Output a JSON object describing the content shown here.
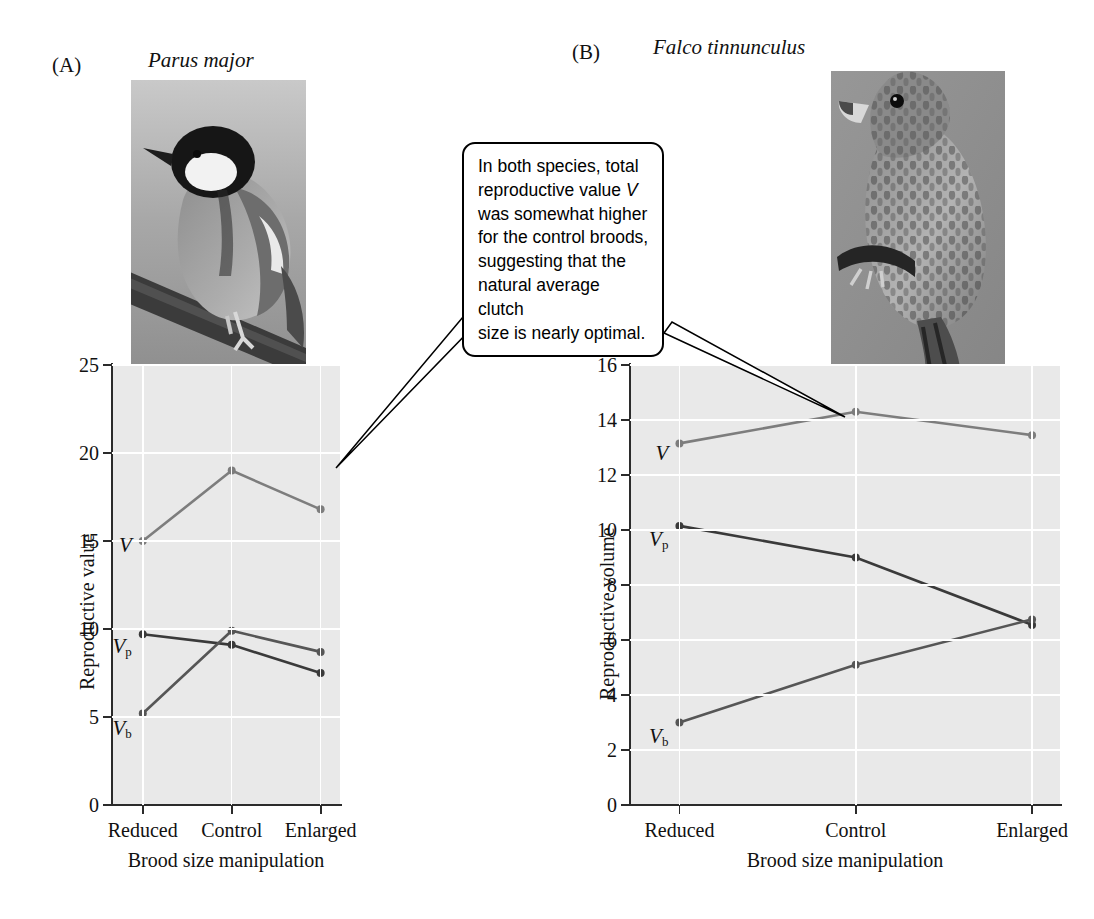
{
  "figure": {
    "panels": [
      {
        "letter": "(A)",
        "species": "Parus major",
        "photo_alt": "great-tit-photo",
        "ylabel": "Reproductive value",
        "xlabel": "Brood size manipulation"
      },
      {
        "letter": "(B)",
        "species": "Falco tinnunculus",
        "photo_alt": "kestrel-photo",
        "ylabel": "Reproductive volume",
        "xlabel": "Brood size manipulation"
      }
    ]
  },
  "callout": {
    "line1": "In both species, total",
    "line2_a": "reproductive value ",
    "line2_v": "V",
    "line3": "was somewhat higher",
    "line4": "for the control broods,",
    "line5": "suggesting that the",
    "line6": "natural average clutch",
    "line7": "size is nearly optimal.",
    "full_text": "In both species, total reproductive value V was somewhat higher for the control broods, suggesting that the natural average clutch size is nearly optimal."
  },
  "series_labels": {
    "v": "V",
    "vp_base": "V",
    "vp_sub": "p",
    "vb_base": "V",
    "vb_sub": "b"
  },
  "colors": {
    "plot_background": "#e9e9e9",
    "gridline": "#ffffff",
    "axis": "#2b2b2b",
    "series_v": "#7d7d7d",
    "series_vp": "#3a3a3a",
    "series_vb": "#565656",
    "photo_background": "#8f8f8f",
    "callout_border": "#000000",
    "text": "#111111"
  },
  "chart_data": [
    {
      "type": "line",
      "title": "Parus major",
      "panel": "(A)",
      "xlabel": "Brood size manipulation",
      "ylabel": "Reproductive value",
      "categories": [
        "Reduced",
        "Control",
        "Enlarged"
      ],
      "ylim": [
        0,
        25
      ],
      "yticks": [
        0,
        5,
        10,
        15,
        20,
        25
      ],
      "grid": true,
      "legend": "inline-labels-left",
      "series": [
        {
          "name": "V",
          "label": "V",
          "values": [
            15.0,
            19.0,
            16.8
          ]
        },
        {
          "name": "V_p",
          "label": "Vp",
          "values": [
            9.7,
            9.1,
            7.5
          ]
        },
        {
          "name": "V_b",
          "label": "Vb",
          "values": [
            5.2,
            9.9,
            8.7
          ]
        }
      ]
    },
    {
      "type": "line",
      "title": "Falco tinnunculus",
      "panel": "(B)",
      "xlabel": "Brood size manipulation",
      "ylabel": "Reproductive volume",
      "categories": [
        "Reduced",
        "Control",
        "Enlarged"
      ],
      "ylim": [
        0,
        16
      ],
      "yticks": [
        0,
        2,
        4,
        6,
        8,
        10,
        12,
        14,
        16
      ],
      "grid": true,
      "legend": "inline-labels-left",
      "series": [
        {
          "name": "V",
          "label": "V",
          "values": [
            13.15,
            14.3,
            13.45
          ]
        },
        {
          "name": "V_p",
          "label": "Vp",
          "values": [
            10.15,
            9.0,
            6.55
          ]
        },
        {
          "name": "V_b",
          "label": "Vb",
          "values": [
            3.0,
            5.1,
            6.75
          ]
        }
      ]
    }
  ],
  "axis_a": {
    "yticks": [
      "0",
      "5",
      "10",
      "15",
      "20",
      "25"
    ],
    "xticks": [
      "Reduced",
      "Control",
      "Enlarged"
    ]
  },
  "axis_b": {
    "yticks": [
      "0",
      "2",
      "4",
      "6",
      "8",
      "10",
      "12",
      "14",
      "16"
    ],
    "xticks": [
      "Reduced",
      "Control",
      "Enlarged"
    ]
  }
}
